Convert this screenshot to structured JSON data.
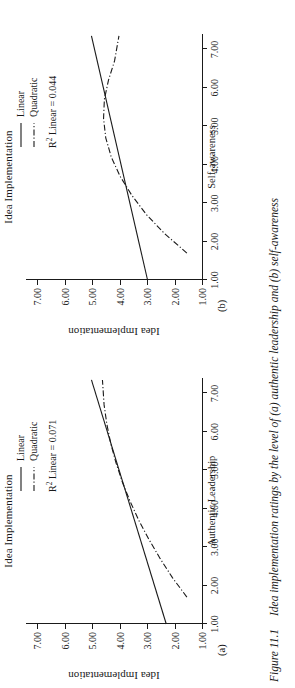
{
  "caption": {
    "figure_number": "Figure 11.1",
    "text": "Idea implementation ratings by the level of (a) authentic leadership and (b) self-awareness"
  },
  "panels": [
    {
      "letter": "(a)",
      "title": "Idea Implementation",
      "legend": {
        "linear_label": "Linear",
        "quadratic_label": "Quadratic",
        "r2_prefix": "R",
        "r2_exponent": "2",
        "r2_text": " Linear = 0.071"
      }
    },
    {
      "letter": "(b)",
      "title": "Idea Implementation",
      "legend": {
        "linear_label": "Linear",
        "quadratic_label": "Quadratic",
        "r2_prefix": "R",
        "r2_exponent": "2",
        "r2_text": " Linear = 0.044"
      }
    }
  ],
  "chart_data": [
    {
      "type": "line",
      "panel": "(a)",
      "title": "Idea Implementation",
      "xlabel": "Authentic Leadership",
      "ylabel": "Idea Implementation",
      "xlim": [
        1.0,
        7.4
      ],
      "ylim": [
        1.0,
        7.4
      ],
      "xticks": [
        "1.00",
        "2.00",
        "3.00",
        "4.00",
        "5.00",
        "6.00",
        "7.00"
      ],
      "yticks": [
        "1.00",
        "2.00",
        "3.00",
        "4.00",
        "5.00",
        "6.00",
        "7.00"
      ],
      "xtick_values": [
        1,
        2,
        3,
        4,
        5,
        6,
        7
      ],
      "ytick_values": [
        1,
        2,
        3,
        4,
        5,
        6,
        7
      ],
      "grid": false,
      "legend_position": "top-right",
      "r2_linear": 0.071,
      "series": [
        {
          "name": "Linear",
          "style": "solid",
          "x": [
            1.0,
            7.35
          ],
          "y": [
            2.3,
            5.02
          ]
        },
        {
          "name": "Quadratic",
          "style": "dash-dot",
          "x": [
            1.7,
            2.2,
            2.7,
            3.2,
            3.7,
            4.2,
            4.7,
            5.2,
            5.7,
            6.2,
            6.7,
            7.35
          ],
          "y": [
            1.55,
            2.07,
            2.52,
            2.93,
            3.3,
            3.62,
            3.9,
            4.13,
            4.32,
            4.46,
            4.56,
            4.62
          ]
        }
      ]
    },
    {
      "type": "line",
      "panel": "(b)",
      "title": "Idea Implementation",
      "xlabel": "Self-awareness",
      "ylabel": "Idea Implementation",
      "xlim": [
        1.0,
        7.4
      ],
      "ylim": [
        1.0,
        7.4
      ],
      "xticks": [
        "1.00",
        "2.00",
        "3.00",
        "4.00",
        "5.00",
        "6.00",
        "7.00"
      ],
      "yticks": [
        "1.00",
        "2.00",
        "3.00",
        "4.00",
        "5.00",
        "6.00",
        "7.00"
      ],
      "xtick_values": [
        1,
        2,
        3,
        4,
        5,
        6,
        7
      ],
      "ytick_values": [
        1,
        2,
        3,
        4,
        5,
        6,
        7
      ],
      "grid": false,
      "legend_position": "top-right",
      "r2_linear": 0.044,
      "series": [
        {
          "name": "Linear",
          "style": "solid",
          "x": [
            1.0,
            7.35
          ],
          "y": [
            2.98,
            5.02
          ]
        },
        {
          "name": "Quadratic",
          "style": "dash-dot",
          "x": [
            1.7,
            2.2,
            2.7,
            3.2,
            3.7,
            4.2,
            4.7,
            5.2,
            5.7,
            6.2,
            6.7,
            7.35
          ],
          "y": [
            1.55,
            2.35,
            3.02,
            3.55,
            3.98,
            4.3,
            4.5,
            4.58,
            4.55,
            4.4,
            4.18,
            4.02
          ]
        }
      ]
    }
  ]
}
